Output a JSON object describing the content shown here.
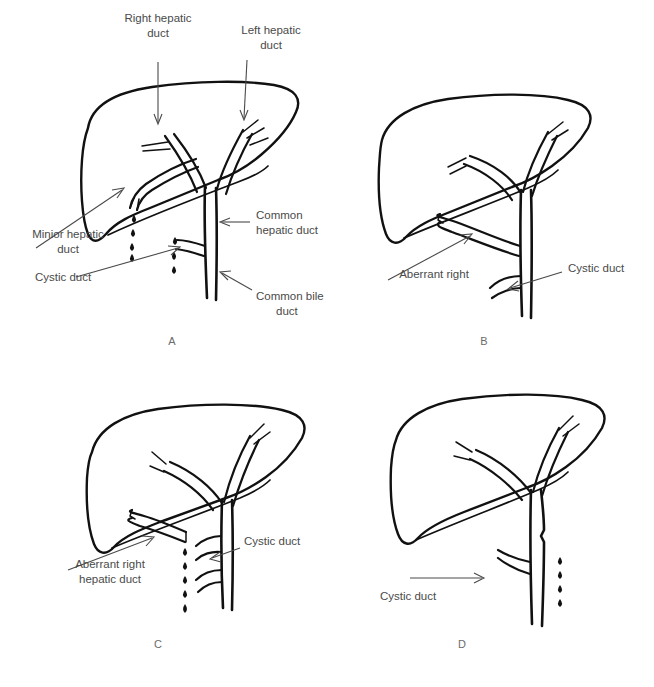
{
  "figure": {
    "background_color": "#ffffff",
    "ink_color": "#111111",
    "label_color": "#4a4a4a",
    "panel_letter_color": "#6b6b6b"
  },
  "panels": [
    {
      "letter": "A",
      "name": "normal-biliary-anatomy",
      "labels": [
        {
          "id": "right-hepatic-duct",
          "line1": "Right hepatic",
          "line2": "duct"
        },
        {
          "id": "left-hepatic-duct",
          "line1": "Left hepatic",
          "line2": "duct"
        },
        {
          "id": "minior-hepatic-duct",
          "line1": "Minior hepatic",
          "line2": "duct"
        },
        {
          "id": "common-hepatic-duct",
          "line1": "Common",
          "line2": "hepatic duct"
        },
        {
          "id": "cystic-duct",
          "line1": "Cystic duct",
          "line2": ""
        },
        {
          "id": "common-bile-duct",
          "line1": "Common bile",
          "line2": "duct"
        }
      ],
      "bile_leak": true,
      "droplet_count": 7
    },
    {
      "letter": "B",
      "name": "aberrant-right-hepatic-duct-intact",
      "labels": [
        {
          "id": "aberrant-right-hepatic-duct",
          "line1": "Aberrant right",
          "line2": "hepatic duct"
        },
        {
          "id": "cystic-duct",
          "line1": "Cystic duct",
          "line2": ""
        }
      ],
      "bile_leak": false,
      "droplet_count": 0
    },
    {
      "letter": "C",
      "name": "aberrant-right-hepatic-duct-transected",
      "labels": [
        {
          "id": "aberrant-right-hepatic-duct",
          "line1": "Aberrant right",
          "line2": "hepatic duct"
        },
        {
          "id": "cystic-duct",
          "line1": "Cystic duct",
          "line2": ""
        }
      ],
      "bile_leak": true,
      "droplet_count": 5
    },
    {
      "letter": "D",
      "name": "cystic-duct-stump-leak",
      "labels": [
        {
          "id": "cystic-duct",
          "line1": "Cystic duct",
          "line2": ""
        }
      ],
      "bile_leak": true,
      "droplet_count": 4
    }
  ]
}
